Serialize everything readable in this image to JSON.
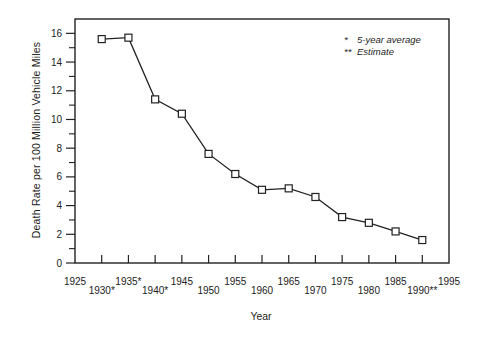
{
  "chart_data": {
    "type": "line",
    "title": "",
    "xlabel": "Year",
    "ylabel": "Death Rate per 100 Million Vehicle Miles",
    "x": [
      1930,
      1935,
      1940,
      1945,
      1950,
      1955,
      1960,
      1965,
      1970,
      1975,
      1980,
      1985,
      1990
    ],
    "values": [
      15.6,
      15.7,
      11.4,
      10.4,
      7.6,
      6.2,
      5.1,
      5.2,
      4.6,
      3.2,
      2.8,
      2.2,
      1.6
    ],
    "xlim": [
      1925,
      1995
    ],
    "ylim": [
      0,
      17
    ],
    "grid": false,
    "marker": "open-square",
    "line_color": "#222222",
    "background_color": "#ffffff",
    "y_major_ticks": [
      0,
      2,
      4,
      6,
      8,
      10,
      12,
      14,
      16
    ],
    "y_minor_ticks": [
      1,
      3,
      5,
      7,
      9,
      11,
      13,
      15
    ],
    "x_ticks": [
      1930,
      1935,
      1940,
      1945,
      1950,
      1955,
      1960,
      1965,
      1970,
      1975,
      1980,
      1985,
      1990
    ],
    "x_tick_labels": [
      {
        "year": 1925,
        "label": "1925",
        "row": 1
      },
      {
        "year": 1930,
        "label": "1930*",
        "row": 2
      },
      {
        "year": 1935,
        "label": "1935*",
        "row": 1
      },
      {
        "year": 1940,
        "label": "1940*",
        "row": 2
      },
      {
        "year": 1945,
        "label": "1945",
        "row": 1
      },
      {
        "year": 1950,
        "label": "1950",
        "row": 2
      },
      {
        "year": 1955,
        "label": "1955",
        "row": 1
      },
      {
        "year": 1960,
        "label": "1960",
        "row": 2
      },
      {
        "year": 1965,
        "label": "1965",
        "row": 1
      },
      {
        "year": 1970,
        "label": "1970",
        "row": 2
      },
      {
        "year": 1975,
        "label": "1975",
        "row": 1
      },
      {
        "year": 1980,
        "label": "1980",
        "row": 2
      },
      {
        "year": 1985,
        "label": "1985",
        "row": 1
      },
      {
        "year": 1990,
        "label": "1990**",
        "row": 2
      },
      {
        "year": 1995,
        "label": "1995",
        "row": 1
      }
    ],
    "legend_position": "upper-right-inside",
    "legend": [
      {
        "symbol": "*",
        "text": "5-year average"
      },
      {
        "symbol": "**",
        "text": "Estimate"
      }
    ]
  }
}
